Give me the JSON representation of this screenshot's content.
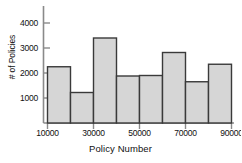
{
  "chart_data": {
    "type": "bar",
    "title": "",
    "subtitle": "",
    "xlabel": "Policy Number",
    "ylabel": "# of Policies",
    "bin_width": 10000,
    "bin_edges": [
      10000,
      20000,
      30000,
      40000,
      50000,
      60000,
      70000,
      80000,
      90000
    ],
    "categories": [
      "10000-20000",
      "20000-30000",
      "30000-40000",
      "40000-50000",
      "50000-60000",
      "60000-70000",
      "70000-80000",
      "80000-90000"
    ],
    "values": [
      2250,
      1220,
      3400,
      1880,
      1900,
      2820,
      1650,
      2350
    ],
    "xlim": [
      10000,
      90000
    ],
    "ylim": [
      0,
      4250
    ],
    "xticks": [
      10000,
      30000,
      50000,
      70000,
      90000
    ],
    "xticklabels": [
      "10000",
      "30000",
      "50000",
      "70000",
      "90000"
    ],
    "yticks": [
      1000,
      2000,
      3000,
      4000
    ],
    "yticklabels": [
      "1000",
      "2000",
      "3000",
      "4000"
    ],
    "grid": false,
    "legend": null,
    "legend_position": "none",
    "bar_fill_color": "#d6d6d6",
    "bar_edge_color": "#3a3a3a",
    "axis_color": "#808080"
  }
}
